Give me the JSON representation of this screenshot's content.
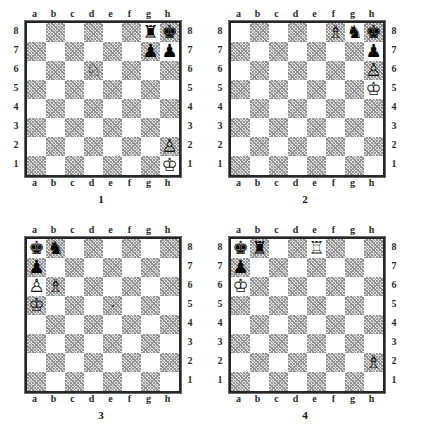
{
  "document": {
    "kind": "chess-puzzle-diagram-sheet",
    "board_count": 4
  },
  "files": [
    "a",
    "b",
    "c",
    "d",
    "e",
    "f",
    "g",
    "h"
  ],
  "ranks": [
    "8",
    "7",
    "6",
    "5",
    "4",
    "3",
    "2",
    "1"
  ],
  "glyphs": {
    "white_king": "♔",
    "white_queen": "♕",
    "white_rook": "♖",
    "white_bishop": "♗",
    "white_knight": "♘",
    "white_pawn": "♙",
    "black_king": "♚",
    "black_queen": "♛",
    "black_rook": "♜",
    "black_bishop": "♝",
    "black_knight": "♞",
    "black_pawn": "♟"
  },
  "colors": {
    "light_square": "#ffffff",
    "dark_square": "#e4e4e4",
    "border": "#262626",
    "text": "#1a1a1a"
  },
  "boards": [
    {
      "caption": "1",
      "rank_labels_left": true,
      "rank_labels_right": true,
      "files_top": true,
      "files_bottom": true,
      "pieces": [
        {
          "square": "g8",
          "color": "black",
          "type": "rook",
          "name": "black-rook-g8"
        },
        {
          "square": "h8",
          "color": "black",
          "type": "king",
          "name": "black-king-h8"
        },
        {
          "square": "g7",
          "color": "black",
          "type": "pawn",
          "name": "black-pawn-g7"
        },
        {
          "square": "h7",
          "color": "black",
          "type": "pawn",
          "name": "black-pawn-h7"
        },
        {
          "square": "d6",
          "color": "white",
          "type": "knight",
          "name": "white-knight-d6"
        },
        {
          "square": "h2",
          "color": "white",
          "type": "pawn",
          "name": "white-pawn-h2"
        },
        {
          "square": "h1",
          "color": "white",
          "type": "king",
          "name": "white-king-h1"
        }
      ]
    },
    {
      "caption": "2",
      "rank_labels_left": true,
      "rank_labels_right": true,
      "files_top": true,
      "files_bottom": true,
      "pieces": [
        {
          "square": "f8",
          "color": "white",
          "type": "bishop",
          "name": "white-bishop-f8"
        },
        {
          "square": "g8",
          "color": "black",
          "type": "knight",
          "name": "black-knight-g8"
        },
        {
          "square": "h8",
          "color": "black",
          "type": "king",
          "name": "black-king-h8"
        },
        {
          "square": "h7",
          "color": "black",
          "type": "pawn",
          "name": "black-pawn-h7"
        },
        {
          "square": "h6",
          "color": "white",
          "type": "pawn",
          "name": "white-pawn-h6"
        },
        {
          "square": "h5",
          "color": "white",
          "type": "king",
          "name": "white-king-h5"
        }
      ]
    },
    {
      "caption": "3",
      "rank_labels_left": false,
      "rank_labels_right": true,
      "files_top": true,
      "files_bottom": true,
      "pieces": [
        {
          "square": "a8",
          "color": "black",
          "type": "king",
          "name": "black-king-a8"
        },
        {
          "square": "b8",
          "color": "black",
          "type": "knight",
          "name": "black-knight-b8"
        },
        {
          "square": "a7",
          "color": "black",
          "type": "pawn",
          "name": "black-pawn-a7"
        },
        {
          "square": "a6",
          "color": "white",
          "type": "pawn",
          "name": "white-pawn-a6"
        },
        {
          "square": "b6",
          "color": "white",
          "type": "bishop",
          "name": "white-bishop-b6"
        },
        {
          "square": "a5",
          "color": "white",
          "type": "king",
          "name": "white-king-a5"
        }
      ]
    },
    {
      "caption": "4",
      "rank_labels_left": true,
      "rank_labels_right": true,
      "files_top": true,
      "files_bottom": true,
      "pieces": [
        {
          "square": "a8",
          "color": "black",
          "type": "king",
          "name": "black-king-a8"
        },
        {
          "square": "b8",
          "color": "black",
          "type": "rook",
          "name": "black-rook-b8"
        },
        {
          "square": "e8",
          "color": "white",
          "type": "rook",
          "name": "white-rook-e8"
        },
        {
          "square": "a7",
          "color": "black",
          "type": "pawn",
          "name": "black-pawn-a7"
        },
        {
          "square": "a6",
          "color": "white",
          "type": "king",
          "name": "white-king-a6"
        },
        {
          "square": "h2",
          "color": "white",
          "type": "bishop",
          "name": "white-bishop-h2"
        }
      ]
    }
  ]
}
